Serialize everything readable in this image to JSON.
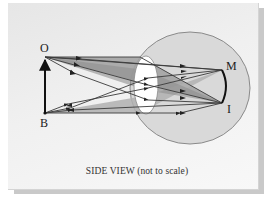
{
  "diagram": {
    "caption": "SIDE VIEW (not to scale)",
    "points": {
      "object_top": "O",
      "object_bottom": "B",
      "image_top": "M",
      "image_bottom": "I"
    },
    "colors": {
      "background": "#efefef",
      "eye_fill": "#d8d8d8",
      "eye_stroke": "#8a8a8a",
      "lens_fill": "#ffffff",
      "ray_cone_fill": "#9d9d9d",
      "ray_stroke": "#3a3a3a",
      "object_arrow": "#111111"
    }
  }
}
